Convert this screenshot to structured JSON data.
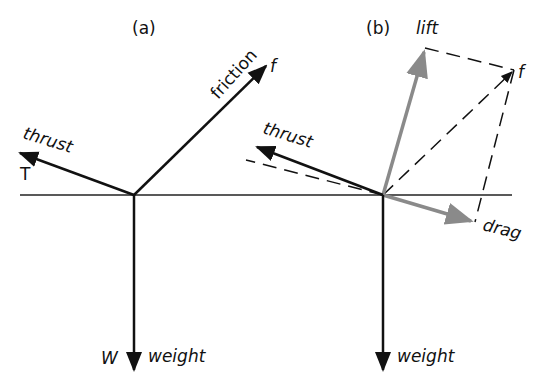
{
  "panels": {
    "a": {
      "title": "(a)",
      "labels": {
        "thrust": "thrust",
        "thrust_symbol": "T",
        "friction": "friction",
        "friction_symbol": "f",
        "weight": "weight",
        "weight_symbol": "W"
      }
    },
    "b": {
      "title": "(b)",
      "labels": {
        "lift": "lift",
        "resultant_symbol": "f",
        "thrust": "thrust",
        "drag": "drag",
        "weight": "weight"
      }
    }
  },
  "colors": {
    "ink": "#111111",
    "component_gray": "#8a8a8a",
    "background": "#ffffff"
  }
}
